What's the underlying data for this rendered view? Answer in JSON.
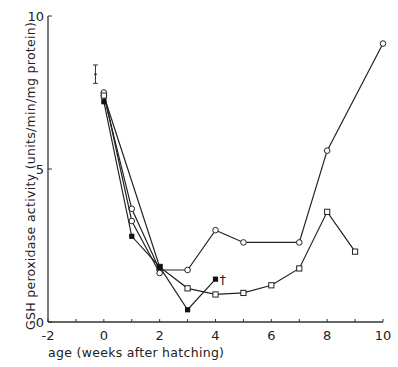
{
  "chart_data": {
    "type": "line",
    "title": "",
    "xlabel": "age (weeks after hatching)",
    "ylabel": "GSH peroxidase activity (units/min/mg protein)",
    "xlim": [
      -2,
      10
    ],
    "ylim": [
      0,
      10
    ],
    "x_ticks": [
      -2,
      -1,
      0,
      1,
      2,
      3,
      4,
      5,
      6,
      7,
      8,
      9,
      10
    ],
    "x_tick_labels": [
      "-2",
      "0",
      "2",
      "4",
      "6",
      "8",
      "10"
    ],
    "y_tick_labels": [
      "0",
      "5",
      "10"
    ],
    "grid": false,
    "legend": "none",
    "reference_point": {
      "x": -0.3,
      "y": 8.1,
      "error_low": 7.8,
      "error_high": 8.4,
      "marker": "error-bar"
    },
    "series": [
      {
        "name": "open circles",
        "marker": "circle-open",
        "x": [
          0,
          1,
          2,
          3,
          4,
          5,
          7,
          8,
          10
        ],
        "y": [
          7.4,
          3.7,
          1.7,
          1.7,
          3.0,
          2.6,
          2.6,
          5.6,
          9.1
        ]
      },
      {
        "name": "open circles (second)",
        "marker": "circle-open",
        "x": [
          0,
          1,
          2
        ],
        "y": [
          7.5,
          3.3,
          1.6
        ]
      },
      {
        "name": "open squares",
        "marker": "square-open",
        "x": [
          0,
          2,
          3,
          4,
          5,
          6,
          7,
          8,
          9
        ],
        "y": [
          7.4,
          1.8,
          1.1,
          0.9,
          0.95,
          1.2,
          1.75,
          3.6,
          2.3
        ]
      },
      {
        "name": "filled squares",
        "marker": "square-filled",
        "x": [
          0,
          1,
          2,
          3,
          4
        ],
        "y": [
          7.2,
          2.8,
          1.8,
          0.4,
          1.4
        ],
        "annotation": "†"
      }
    ]
  },
  "labels": {
    "x_ticks": [
      {
        "v": -2,
        "t": "-2"
      },
      {
        "v": 0,
        "t": "0"
      },
      {
        "v": 2,
        "t": "2"
      },
      {
        "v": 4,
        "t": "4"
      },
      {
        "v": 6,
        "t": "6"
      },
      {
        "v": 8,
        "t": "8"
      },
      {
        "v": 10,
        "t": "10"
      }
    ],
    "y_ticks": [
      {
        "v": 0,
        "t": "0"
      },
      {
        "v": 5,
        "t": "5"
      },
      {
        "v": 10,
        "t": "10"
      }
    ],
    "dagger": "†"
  }
}
